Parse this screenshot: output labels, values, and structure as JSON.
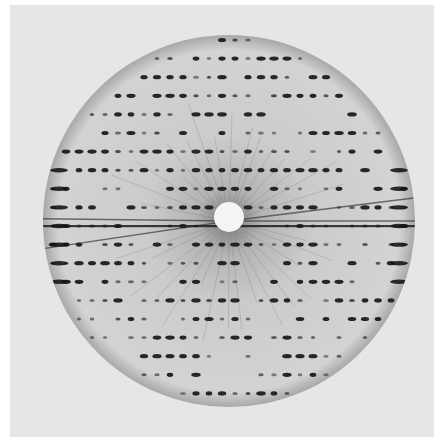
{
  "image": {
    "subject": "X-ray diffraction pattern",
    "alt": "Greyscale X-ray diffraction photograph showing a rectangular lattice of dark spots inside a circular field, with a bright beam stop at the center and radial streaks",
    "colors": {
      "paper": "#e6e6e6",
      "disc": "#cfcfcf",
      "disc_edge": "#a9a9a9",
      "spot": "#1a1a1a",
      "beam_stop": "#f4f4f4",
      "halo": "#8a8a8a"
    },
    "center": {
      "x": 229,
      "y": 221
    },
    "disc_radius": 186,
    "beam_stop_radius": 15,
    "lattice": {
      "row_pitch": 18.6,
      "col_pitch": 13.0,
      "rows": 21,
      "cols": 30
    }
  }
}
